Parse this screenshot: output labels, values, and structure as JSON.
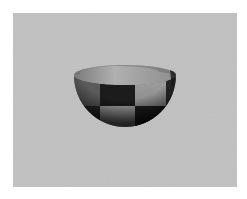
{
  "image": {
    "subject": "checkered hemisphere bowl",
    "background_color": "#bdbdbd",
    "margin_color": "#ffffff",
    "colors": {
      "light_square": "#9a9a9a",
      "dark_square": "#1c1c1c",
      "inner_rim": "#a8a8a8",
      "shadow_edge": "#151515"
    }
  }
}
